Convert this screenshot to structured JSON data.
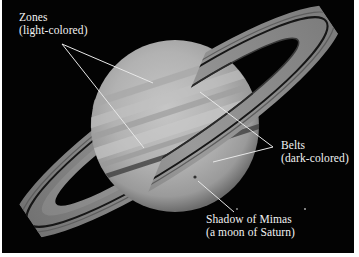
{
  "figure": {
    "background_color": "#030303",
    "planet_color": "#b0b0b0",
    "ring_color": "#8a8a8a",
    "leader_line_color": "#e8e8e8"
  },
  "annotations": [
    {
      "id": "zones",
      "title": "Zones",
      "subtitle": "(light-colored)"
    },
    {
      "id": "belts",
      "title": "Belts",
      "subtitle": "(dark-colored)"
    },
    {
      "id": "mimas",
      "title": "Shadow of Mimas",
      "subtitle": "(a moon of Saturn)"
    }
  ]
}
